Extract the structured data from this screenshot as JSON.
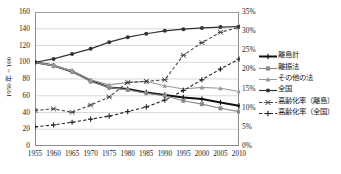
{
  "chart_data": {
    "type": "line",
    "title": "",
    "xlabel": "",
    "ylabel": "1950 年 = 100",
    "ylabel_right": "",
    "x": [
      1955,
      1960,
      1965,
      1970,
      1975,
      1980,
      1985,
      1990,
      1995,
      2000,
      2005,
      2010
    ],
    "xticklabels": [
      "1955",
      "1960",
      "1965",
      "1970",
      "1975",
      "1980",
      "1985",
      "1990",
      "1995",
      "2000",
      "2005",
      "2010"
    ],
    "ylim": [
      0,
      160
    ],
    "yticks": [
      0,
      20,
      40,
      60,
      80,
      100,
      120,
      140,
      160
    ],
    "yticklabels": [
      "0",
      "20",
      "40",
      "60",
      "80",
      "100",
      "120",
      "140",
      "160"
    ],
    "ylim_right": [
      0,
      35
    ],
    "yticks_right": [
      0,
      5,
      10,
      15,
      20,
      25,
      30,
      35
    ],
    "yticklabels_right": [
      "0%",
      "5%",
      "10%",
      "15%",
      "20%",
      "25%",
      "30%",
      "35%"
    ],
    "grid": true,
    "legend_position": "right",
    "series": [
      {
        "name": "離島計",
        "axis": "left",
        "style": "solid",
        "color": "#111111",
        "width": 2.0,
        "marker": "plus",
        "values": [
          100,
          96,
          89,
          78,
          70,
          68,
          64,
          61,
          58,
          56,
          52,
          48
        ]
      },
      {
        "name": "離振法",
        "axis": "left",
        "style": "solid",
        "color": "#8a8a8a",
        "width": 1.1,
        "marker": "square",
        "values": [
          100,
          96,
          89,
          77,
          70,
          67,
          63,
          60,
          54,
          50,
          45,
          41
        ]
      },
      {
        "name": "その他の法",
        "axis": "left",
        "style": "solid",
        "color": "#9a9a9a",
        "width": 1.1,
        "marker": "triangle",
        "values": [
          100,
          96,
          90,
          79,
          73,
          76,
          77,
          72,
          68,
          70,
          69,
          65
        ]
      },
      {
        "name": "全国",
        "axis": "left",
        "style": "solid",
        "color": "#333333",
        "width": 1.2,
        "marker": "circle",
        "values": [
          100,
          104,
          110,
          116,
          124,
          130,
          134,
          137.5,
          139.5,
          141,
          142,
          142.5
        ]
      },
      {
        "name": "高齢化率（離島）",
        "axis": "right",
        "style": "dashed",
        "color": "#444444",
        "width": 1.1,
        "marker": "star",
        "values": [
          9.3,
          9.7,
          8.8,
          10.7,
          12.8,
          16.6,
          16.9,
          17.3,
          23.7,
          27.0,
          29.7,
          31.0
        ]
      },
      {
        "name": "高齢化率（全国）",
        "axis": "right",
        "style": "dashed",
        "color": "#222222",
        "width": 1.1,
        "marker": "plus",
        "values": [
          5.0,
          5.5,
          6.2,
          7.0,
          7.8,
          9.0,
          10.2,
          12.0,
          14.5,
          17.3,
          20.1,
          22.7
        ]
      }
    ]
  },
  "legend": {
    "items": [
      {
        "label": "離島計"
      },
      {
        "label": "離振法"
      },
      {
        "label": "その他の法"
      },
      {
        "label": "全国"
      },
      {
        "label": "高齢化率（離島）"
      },
      {
        "label": "高齢化率（全国）"
      }
    ]
  }
}
